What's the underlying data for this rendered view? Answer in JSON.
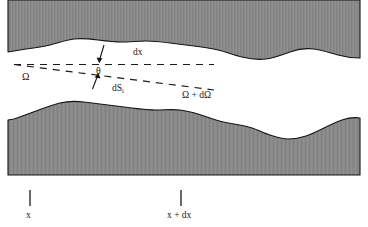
{
  "figure": {
    "type": "scientific-diagram",
    "width": 368,
    "height": 227,
    "background_color": "#ffffff",
    "shaded_fill_color": "#8a8a8a",
    "boundary_line_color": "#141414",
    "dashed_line_color": "#1a1a1a",
    "text_color": "#1a1a1a"
  },
  "labels": {
    "dx": "dx",
    "theta": "θ",
    "dS": "dS",
    "dS_subscript": "i",
    "omega": "Ω",
    "omega_plus_domega": "Ω + dΩ",
    "x": "x",
    "x_plus_dx": "x + dx"
  },
  "axis_ticks": [
    {
      "name": "x",
      "label": "x",
      "x": 30
    },
    {
      "name": "x-plus-dx",
      "label": "x + dx",
      "x": 181
    }
  ],
  "geometry": {
    "upper_band": {
      "top": 0,
      "description": "upper shaded solid region with irregular lower boundary"
    },
    "lower_band": {
      "bottom": 175,
      "description": "lower shaded solid region with irregular upper boundary"
    },
    "dashed_rays": {
      "origin": {
        "x": 14,
        "y": 65
      },
      "upper_end": {
        "x": 212,
        "y": 65
      },
      "lower_end": {
        "x": 212,
        "y": 90
      }
    },
    "angle_arrows": {
      "top_arrow": {
        "from": {
          "x": 103,
          "y": 46
        },
        "to": {
          "x": 98,
          "y": 62
        }
      },
      "bottom_arrow": {
        "from": {
          "x": 93,
          "y": 88
        },
        "to": {
          "x": 99,
          "y": 74
        }
      }
    }
  }
}
